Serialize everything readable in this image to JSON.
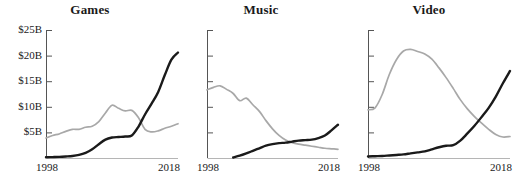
{
  "figure": {
    "width": 516,
    "height": 184,
    "background": "#ffffff",
    "series_colors": {
      "physical": "#a8a8a8",
      "digital": "#1a1a1a"
    }
  },
  "chart_data": [
    {
      "type": "line",
      "title": "Games",
      "xlabel": "",
      "ylabel": "",
      "xlim": [
        1998,
        2018
      ],
      "ylim": [
        0,
        25
      ],
      "grid": false,
      "legend": "none",
      "ytick_labels": [
        "$5B",
        "$10B",
        "$15B",
        "$20B",
        "$25B"
      ],
      "ytick_values": [
        5,
        10,
        15,
        20,
        25
      ],
      "xtick_labels": [
        "1998",
        "2018"
      ],
      "xtick_values": [
        1998,
        2018
      ],
      "x": [
        1998,
        1999,
        2000,
        2001,
        2002,
        2003,
        2004,
        2005,
        2006,
        2007,
        2008,
        2009,
        2010,
        2011,
        2012,
        2013,
        2014,
        2015,
        2016,
        2017,
        2018
      ],
      "series": [
        {
          "name": "physical",
          "color": "#a8a8a8",
          "values": [
            3.9,
            4.4,
            4.7,
            5.2,
            5.6,
            5.6,
            6.0,
            6.2,
            7.1,
            8.8,
            10.3,
            9.7,
            9.2,
            9.3,
            7.9,
            5.6,
            5.1,
            5.3,
            5.8,
            6.2,
            6.7
          ]
        },
        {
          "name": "digital",
          "color": "#1a1a1a",
          "values": [
            0.15,
            0.18,
            0.22,
            0.3,
            0.4,
            0.6,
            1.0,
            1.7,
            2.7,
            3.6,
            4.0,
            4.1,
            4.2,
            4.4,
            6.1,
            8.5,
            10.6,
            12.9,
            16.2,
            19.2,
            20.6
          ]
        }
      ]
    },
    {
      "type": "line",
      "title": "Music",
      "xlabel": "",
      "ylabel": "",
      "xlim": [
        1998,
        2018
      ],
      "ylim": [
        0,
        25
      ],
      "grid": false,
      "legend": "none",
      "ytick_labels": [
        "",
        "",
        "",
        "",
        ""
      ],
      "ytick_values": [
        5,
        10,
        15,
        20,
        25
      ],
      "xtick_labels": [
        "1998",
        "2018"
      ],
      "xtick_values": [
        1998,
        2018
      ],
      "x": [
        1998,
        1999,
        2000,
        2001,
        2002,
        2003,
        2004,
        2005,
        2006,
        2007,
        2008,
        2009,
        2010,
        2011,
        2012,
        2013,
        2014,
        2015,
        2016,
        2017,
        2018
      ],
      "series": [
        {
          "name": "physical",
          "color": "#a8a8a8",
          "values": [
            13.3,
            13.8,
            14.1,
            13.4,
            12.6,
            11.2,
            11.7,
            10.4,
            9.1,
            7.3,
            5.7,
            4.4,
            3.5,
            3.0,
            2.7,
            2.5,
            2.3,
            2.1,
            1.9,
            1.8,
            1.7
          ]
        },
        {
          "name": "digital",
          "color": "#1a1a1a",
          "values": [
            null,
            null,
            null,
            null,
            0.1,
            0.45,
            0.9,
            1.4,
            1.9,
            2.4,
            2.7,
            2.9,
            3.0,
            3.2,
            3.4,
            3.5,
            3.6,
            3.9,
            4.4,
            5.4,
            6.5
          ]
        }
      ]
    },
    {
      "type": "line",
      "title": "Video",
      "xlabel": "",
      "ylabel": "",
      "xlim": [
        1998,
        2018
      ],
      "ylim": [
        0,
        25
      ],
      "grid": false,
      "legend": "none",
      "ytick_labels": [
        "",
        "",
        "",
        "",
        ""
      ],
      "ytick_values": [
        5,
        10,
        15,
        20,
        25
      ],
      "xtick_labels": [
        "1998",
        "2018"
      ],
      "xtick_values": [
        1998,
        2018
      ],
      "x": [
        1998,
        1999,
        2000,
        2001,
        2002,
        2003,
        2004,
        2005,
        2006,
        2007,
        2008,
        2009,
        2010,
        2011,
        2012,
        2013,
        2014,
        2015,
        2016,
        2017,
        2018
      ],
      "series": [
        {
          "name": "physical",
          "color": "#a8a8a8",
          "values": [
            9.4,
            9.8,
            12.4,
            16.3,
            19.2,
            20.9,
            21.2,
            20.8,
            20.3,
            19.3,
            17.6,
            15.7,
            13.6,
            11.4,
            9.6,
            8.1,
            6.8,
            5.6,
            4.6,
            4.1,
            4.2
          ]
        },
        {
          "name": "digital",
          "color": "#1a1a1a",
          "values": [
            0.3,
            0.35,
            0.4,
            0.5,
            0.6,
            0.7,
            0.9,
            1.1,
            1.3,
            1.7,
            2.1,
            2.4,
            2.5,
            3.4,
            4.8,
            6.3,
            8.0,
            9.8,
            12.0,
            14.6,
            17.0
          ]
        }
      ]
    }
  ]
}
